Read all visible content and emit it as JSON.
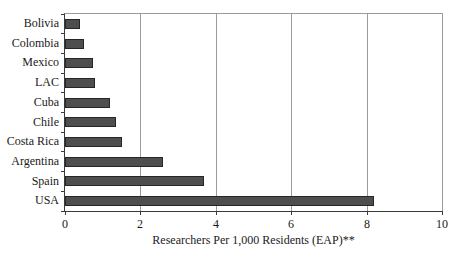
{
  "chart_data": {
    "type": "bar",
    "orientation": "horizontal",
    "categories": [
      "Bolivia",
      "Colombia",
      "Mexico",
      "LAC",
      "Cuba",
      "Chile",
      "Costa Rica",
      "Argentina",
      "Spain",
      "USA"
    ],
    "values": [
      0.4,
      0.5,
      0.75,
      0.8,
      1.2,
      1.35,
      1.5,
      2.6,
      3.7,
      8.2
    ],
    "title": "",
    "xlabel": "Researchers Per 1,000 Residents (EAP)**",
    "ylabel": "",
    "xlim": [
      0,
      10
    ],
    "xticks": [
      0,
      2,
      4,
      6,
      8,
      10
    ],
    "grid": "vertical-major-gridlines",
    "legend": "none",
    "colors": {
      "background": "#ffffff",
      "bar_fill": "#4e4e4e",
      "bar_border": "#262626",
      "gridline": "#9b9b9b",
      "axis": "#3a3a3a",
      "text": "#1a1a1a"
    }
  }
}
